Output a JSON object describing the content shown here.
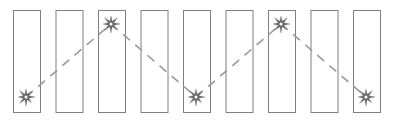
{
  "figure": {
    "width": 396,
    "height": 120,
    "background_color": "#ffffff"
  },
  "chart_data": {
    "type": "diagram",
    "title": "",
    "xlabel": "",
    "ylabel": "",
    "grid": false,
    "legend": "none",
    "bar_count": 9,
    "bar_geometry": {
      "top_y": 10,
      "bottom_y": 112,
      "width": 27,
      "pitch": 42.5,
      "first_left_x": 13
    },
    "bars": [
      {
        "index": 1,
        "x": 13,
        "y": 10,
        "w": 27,
        "h": 102,
        "fill": "#ffffff",
        "stroke": "#808080"
      },
      {
        "index": 2,
        "x": 55.5,
        "y": 10,
        "w": 27,
        "h": 102,
        "fill": "#ffffff",
        "stroke": "#808080"
      },
      {
        "index": 3,
        "x": 98,
        "y": 10,
        "w": 27,
        "h": 102,
        "fill": "#ffffff",
        "stroke": "#808080"
      },
      {
        "index": 4,
        "x": 140.5,
        "y": 10,
        "w": 27,
        "h": 102,
        "fill": "#ffffff",
        "stroke": "#808080"
      },
      {
        "index": 5,
        "x": 183,
        "y": 10,
        "w": 27,
        "h": 102,
        "fill": "#ffffff",
        "stroke": "#808080"
      },
      {
        "index": 6,
        "x": 225.5,
        "y": 10,
        "w": 27,
        "h": 102,
        "fill": "#ffffff",
        "stroke": "#808080"
      },
      {
        "index": 7,
        "x": 268,
        "y": 10,
        "w": 27,
        "h": 102,
        "fill": "#ffffff",
        "stroke": "#808080"
      },
      {
        "index": 8,
        "x": 310.5,
        "y": 10,
        "w": 27,
        "h": 102,
        "fill": "#ffffff",
        "stroke": "#808080"
      },
      {
        "index": 9,
        "x": 353,
        "y": 10,
        "w": 27,
        "h": 102,
        "fill": "#ffffff",
        "stroke": "#808080"
      }
    ],
    "bursts": [
      {
        "id": "burst-1",
        "bar_index": 1,
        "position": "bottom",
        "cx": 26,
        "cy": 97,
        "r": 9
      },
      {
        "id": "burst-2",
        "bar_index": 3,
        "position": "top",
        "cx": 111,
        "cy": 24,
        "r": 9
      },
      {
        "id": "burst-3",
        "bar_index": 5,
        "position": "bottom",
        "cx": 196,
        "cy": 97,
        "r": 9
      },
      {
        "id": "burst-4",
        "bar_index": 7,
        "position": "top",
        "cx": 281,
        "cy": 24,
        "r": 9
      },
      {
        "id": "burst-5",
        "bar_index": 9,
        "position": "bottom",
        "cx": 366,
        "cy": 97,
        "r": 9
      }
    ],
    "zigzag_vertices": [
      {
        "x": 26,
        "y": 97
      },
      {
        "x": 111,
        "y": 24
      },
      {
        "x": 196,
        "y": 97
      },
      {
        "x": 281,
        "y": 24
      },
      {
        "x": 366,
        "y": 97
      }
    ],
    "zigzag_path_d": "M 26 97 L 111 24 L 196 97 L 281 24 L 366 97",
    "line_style": {
      "color": "#9a9a9a",
      "width": 1.6,
      "dash": "9 7"
    },
    "burst_style": {
      "color": "#6b6b6b",
      "points": 8
    }
  }
}
